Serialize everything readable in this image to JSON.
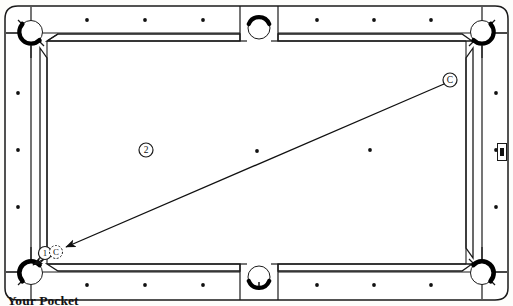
{
  "diagram": {
    "caption": "Your Pocket",
    "surface_color": "#fdfdfb",
    "line_color": "#1a1a1a",
    "pocket_color": "#000000"
  },
  "balls": [
    {
      "id": "cue-ball",
      "label": "C",
      "x": 450,
      "y": 80,
      "r": 7.0,
      "style": "solid-outline"
    },
    {
      "id": "object-ball-2",
      "label": "2",
      "x": 146,
      "y": 150,
      "r": 7.0,
      "style": "solid-outline"
    },
    {
      "id": "object-ball-1",
      "label": "1",
      "x": 45,
      "y": 253,
      "r": 6.5,
      "style": "solid-outline"
    },
    {
      "id": "ghost-cue-ball",
      "label": "C",
      "x": 56,
      "y": 252,
      "r": 6.5,
      "style": "dashed-outline"
    }
  ],
  "shot_line": {
    "from_x": 444,
    "from_y": 84,
    "to_x": 62,
    "to_y": 249,
    "arrow_at": "to",
    "label": "cue-path"
  },
  "pocket_arrow": {
    "from_x": 62,
    "from_y": 249,
    "to_x": 33,
    "to_y": 265,
    "label": "into-pocket"
  },
  "pockets": [
    {
      "name": "top-left-corner",
      "x": 29,
      "y": 30,
      "type": "corner"
    },
    {
      "name": "top-side",
      "x": 259,
      "y": 24,
      "type": "side"
    },
    {
      "name": "top-right-corner",
      "x": 489,
      "y": 30,
      "type": "corner"
    },
    {
      "name": "bottom-left-corner",
      "x": 29,
      "y": 275,
      "type": "corner"
    },
    {
      "name": "bottom-side",
      "x": 259,
      "y": 281,
      "type": "side"
    },
    {
      "name": "bottom-right-corner",
      "x": 489,
      "y": 275,
      "type": "corner"
    }
  ],
  "rail_sights": {
    "top_y": 20,
    "bottom_y": 285,
    "left_x": 18,
    "right_x": 496,
    "top_x": [
      87,
      145,
      203,
      317,
      374,
      431
    ],
    "bottom_x": [
      87,
      145,
      203,
      317,
      374,
      431
    ],
    "left_y": [
      93,
      150,
      207
    ],
    "right_y": [
      93,
      150,
      207
    ]
  },
  "cloth_spots": [
    {
      "name": "center-spot",
      "x": 257,
      "y": 151
    },
    {
      "name": "foot-spot",
      "x": 370,
      "y": 150
    }
  ],
  "rail_marker": {
    "name": "right-rail-marker",
    "x": 502,
    "y": 152,
    "w": 9,
    "h": 16
  }
}
